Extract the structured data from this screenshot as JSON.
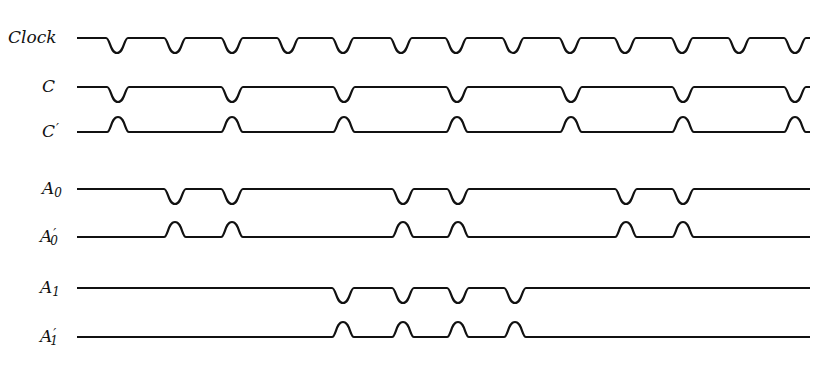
{
  "diagram": {
    "type": "timing-diagram",
    "stroke_color": "#111111",
    "background": "#ffffff",
    "x_start": 77,
    "x_end": 810,
    "pulse_width": 22,
    "pulse_depth": 15,
    "signals": [
      {
        "id": "clock",
        "label": "Clock",
        "sub": "",
        "prime": "",
        "baseline_y": 38,
        "direction": "down",
        "pulses_x": [
          117,
          175,
          232,
          288,
          343,
          401,
          456,
          513,
          570,
          625,
          682,
          739,
          795
        ],
        "label_x": 8,
        "label_y": 29
      },
      {
        "id": "c",
        "label": "C",
        "sub": "",
        "prime": "",
        "baseline_y": 87,
        "direction": "down",
        "pulses_x": [
          118,
          232,
          344,
          457,
          571,
          683,
          795
        ],
        "label_x": 42,
        "label_y": 78
      },
      {
        "id": "c-prime",
        "label": "C",
        "sub": "",
        "prime": "′",
        "baseline_y": 132,
        "direction": "up",
        "pulses_x": [
          118,
          232,
          344,
          457,
          571,
          683,
          795
        ],
        "label_x": 42,
        "label_y": 123
      },
      {
        "id": "a0",
        "label": "A",
        "sub": "0",
        "prime": "",
        "baseline_y": 189,
        "direction": "down",
        "pulses_x": [
          175,
          232,
          403,
          458,
          626,
          683
        ],
        "label_x": 42,
        "label_y": 180
      },
      {
        "id": "a0-prime",
        "label": "A",
        "sub": "0",
        "prime": "′",
        "baseline_y": 237,
        "direction": "up",
        "pulses_x": [
          175,
          232,
          403,
          458,
          626,
          683
        ],
        "label_x": 40,
        "label_y": 228
      },
      {
        "id": "a1",
        "label": "A",
        "sub": "1",
        "prime": "",
        "baseline_y": 288,
        "direction": "down",
        "pulses_x": [
          343,
          403,
          458,
          515
        ],
        "label_x": 40,
        "label_y": 279
      },
      {
        "id": "a1-prime",
        "label": "A",
        "sub": "1",
        "prime": "′",
        "baseline_y": 337,
        "direction": "up",
        "pulses_x": [
          343,
          403,
          458,
          515
        ],
        "label_x": 40,
        "label_y": 328
      }
    ]
  }
}
